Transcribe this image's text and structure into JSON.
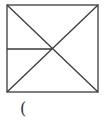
{
  "diagram": {
    "stroke_color": "#3a3a3a",
    "stroke_width": 1.3,
    "square": {
      "x1": 7,
      "y1": 5,
      "x2": 98,
      "y2": 92
    },
    "center": {
      "x": 52,
      "y": 49
    },
    "lines": [
      {
        "name": "diagonal-tl-br",
        "x1": 7,
        "y1": 5,
        "x2": 98,
        "y2": 92
      },
      {
        "name": "diagonal-tr-bl",
        "x1": 98,
        "y1": 5,
        "x2": 7,
        "y2": 92
      },
      {
        "name": "horizontal-left-to-center",
        "x1": 7,
        "y1": 49,
        "x2": 52,
        "y2": 49
      }
    ]
  },
  "caption": {
    "text": "("
  }
}
